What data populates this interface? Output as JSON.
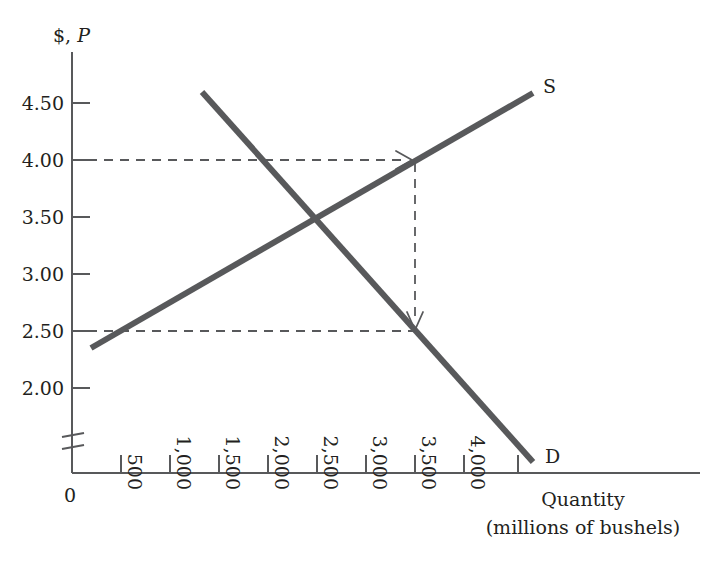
{
  "chart_data": {
    "type": "line",
    "title": "",
    "ylabel": "$, P",
    "xlabel_line1": "Quantity",
    "xlabel_line2": "(millions of bushels)",
    "y_tick_labels": [
      "4.50",
      "4.00",
      "3.50",
      "3.00",
      "2.50",
      "2.00"
    ],
    "y_tick_values": [
      4.5,
      4.0,
      3.5,
      3.0,
      2.5,
      2.0
    ],
    "x_tick_labels": [
      "0",
      "500",
      "1,000",
      "1,500",
      "2,000",
      "2,500",
      "3,000",
      "3,500",
      "4,000"
    ],
    "x_tick_values": [
      0,
      500,
      1000,
      1500,
      2000,
      2500,
      3000,
      3500,
      4000
    ],
    "ylim": [
      1.72,
      4.72
    ],
    "xlim": [
      0,
      4600
    ],
    "axis_break": true,
    "axis_break_note": "y-axis break below 2.00",
    "grid": false,
    "legend_position": "inline-curve-end",
    "series": [
      {
        "name": "S",
        "label": "S",
        "description": "Supply curve, upward sloping",
        "x": [
          200,
          4500
        ],
        "y": [
          2.35,
          4.62
        ],
        "color": "#58595b"
      },
      {
        "name": "D",
        "label": "D",
        "description": "Demand curve, downward sloping",
        "x": [
          1320,
          4500
        ],
        "y": [
          4.62,
          1.79
        ],
        "color": "#58595b"
      }
    ],
    "equilibrium": {
      "quantity": 2500,
      "price": 3.5
    },
    "annotations": [
      {
        "name": "price-ceiling-guide-400",
        "type": "dashed-horizontal-arrow",
        "price": 4.0,
        "from_x": 0,
        "to_x": 3500,
        "arrow": "right",
        "description": "Dashed line at $4.00 from price axis to supply curve"
      },
      {
        "name": "quantity-guide-3500",
        "type": "dashed-vertical-arrow",
        "quantity": 3500,
        "from_price": 4.0,
        "to_price": 2.5,
        "arrow": "down",
        "description": "Dashed vertical line at 3,500 from supply curve down to demand curve"
      },
      {
        "name": "price-guide-250",
        "type": "dashed-horizontal",
        "price": 2.5,
        "from_x": 0,
        "to_x": 3500,
        "arrow": "none",
        "description": "Dashed line at $2.50 from price axis to demand curve"
      }
    ],
    "colors": {
      "curve": "#58595b",
      "axis": "#58595b",
      "text": "#231f20",
      "background": "#ffffff"
    }
  }
}
